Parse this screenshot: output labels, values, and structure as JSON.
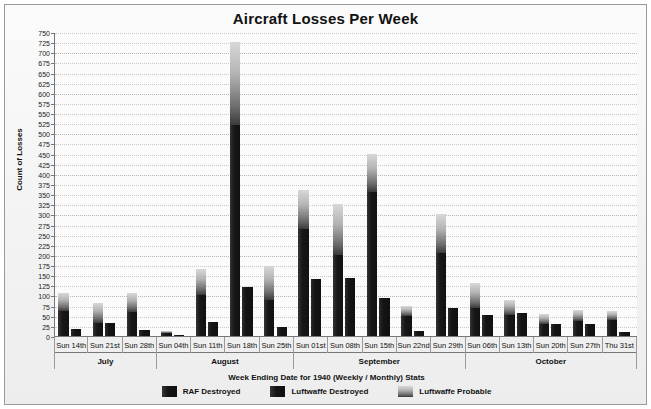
{
  "chart_data": {
    "type": "bar",
    "title": "Aircraft Losses Per Week",
    "xlabel": "Week Ending Date for 1940 (Weekly / Monthly) Stats",
    "ylabel": "Count of Losses",
    "ylim": [
      0,
      750
    ],
    "ytick_step": 25,
    "grid": true,
    "legend_position": "bottom",
    "stacked": true,
    "grouped": true,
    "yticks": [
      0,
      25,
      50,
      75,
      100,
      125,
      150,
      175,
      200,
      225,
      250,
      275,
      300,
      325,
      350,
      375,
      400,
      425,
      450,
      475,
      500,
      525,
      550,
      575,
      600,
      625,
      650,
      675,
      700,
      725,
      750
    ],
    "categories": [
      "Sun 14th",
      "Sun 21st",
      "Sun 28th",
      "Sun 04th",
      "Sun 11th",
      "Sun 18th",
      "Sun 25th",
      "Sun 01st",
      "Sun 08th",
      "Sun 15th",
      "Sun 22nd",
      "Sun 29th",
      "Sun 06th",
      "Sun 13th",
      "Sun 20th",
      "Sun 27th",
      "Thu 31st"
    ],
    "months": [
      {
        "label": "July",
        "count": 3
      },
      {
        "label": "August",
        "count": 4
      },
      {
        "label": "September",
        "count": 5
      },
      {
        "label": "October",
        "count": 5
      }
    ],
    "series": [
      {
        "name": "Luftwaffe Destroyed",
        "color": "#141414",
        "values": [
          62,
          32,
          60,
          8,
          100,
          520,
          90,
          265,
          200,
          355,
          50,
          205,
          68,
          52,
          30,
          38,
          40
        ]
      },
      {
        "name": "Luftwaffe Probable",
        "color": "#b4b4b4",
        "values": [
          45,
          50,
          45,
          5,
          65,
          205,
          82,
          95,
          125,
          95,
          25,
          95,
          62,
          38,
          25,
          25,
          22
        ]
      },
      {
        "name": "RAF Destroyed",
        "color": "#141414",
        "values": [
          18,
          32,
          15,
          3,
          35,
          120,
          22,
          140,
          142,
          95,
          12,
          68,
          52,
          58,
          30,
          30,
          10
        ]
      }
    ],
    "bar_totals_luftwaffe": [
      107,
      82,
      105,
      13,
      165,
      725,
      172,
      360,
      325,
      450,
      75,
      300,
      130,
      90,
      55,
      63,
      62
    ],
    "bar_totals_raf": [
      18,
      32,
      15,
      3,
      35,
      120,
      22,
      140,
      142,
      95,
      12,
      68,
      52,
      58,
      30,
      30,
      10
    ]
  },
  "legend": {
    "items": [
      {
        "label": "RAF Destroyed",
        "color": "#141414",
        "swatch": "solid-dark"
      },
      {
        "label": "Luftwaffe Destroyed",
        "color": "#141414",
        "swatch": "solid-dark"
      },
      {
        "label": "Luftwaffe Probable",
        "color": "#b4b4b4",
        "swatch": "gradient-gray"
      }
    ]
  },
  "colors": {
    "background": "#f3f3f3",
    "plot_background": "#fbfbfb",
    "axis": "#777777",
    "grid": "#c9c9c9",
    "border": "#9a9a9a",
    "text": "#111111"
  }
}
